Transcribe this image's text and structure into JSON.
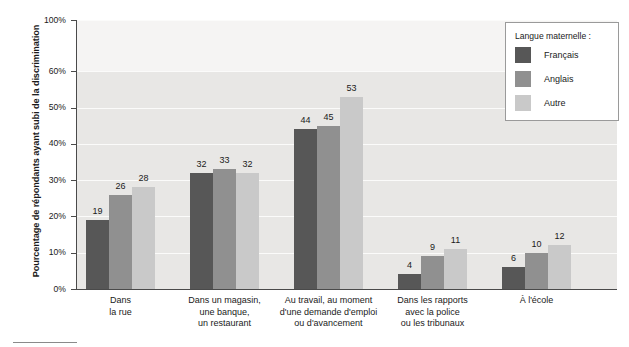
{
  "chart_data": {
    "type": "bar",
    "title": "",
    "xlabel": "",
    "ylabel": "Pourcentage de répondants ayant subi de la discrimination",
    "ylim": [
      0,
      100
    ],
    "grid": true,
    "axis_break": {
      "from": 60,
      "to": 100
    },
    "legend_position": "top-right",
    "legend_title": "Langue maternelle :",
    "categories": [
      "Dans\nla rue",
      "Dans un magasin,\nune banque,\nun restaurant",
      "Au travail, au moment\nd'une demande d'emploi\nou d'avancement",
      "Dans les rapports\navec la police\nou les tribunaux",
      "À l'école"
    ],
    "category_lines": [
      [
        "Dans",
        "la rue"
      ],
      [
        "Dans un magasin,",
        "une banque,",
        "un restaurant"
      ],
      [
        "Au travail, au moment",
        "d'une demande d'emploi",
        "ou d'avancement"
      ],
      [
        "Dans les rapports",
        "avec la police",
        "ou les tribunaux"
      ],
      [
        "À l'école"
      ]
    ],
    "series": [
      {
        "name": "Français",
        "color": "#575757",
        "values": [
          19,
          32,
          44,
          4,
          6
        ]
      },
      {
        "name": "Anglais",
        "color": "#909090",
        "values": [
          26,
          33,
          45,
          9,
          10
        ]
      },
      {
        "name": "Autre",
        "color": "#c9c9c9",
        "values": [
          28,
          32,
          53,
          11,
          12
        ]
      }
    ],
    "ytick_labels": [
      "100%",
      "60%",
      "50%",
      "40%",
      "30%",
      "20%",
      "10%",
      "0%"
    ],
    "ytick_values": [
      100,
      60,
      50,
      40,
      30,
      20,
      10,
      0
    ]
  },
  "legend": {
    "title": "Langue maternelle :",
    "items": [
      {
        "label": "Français",
        "color": "#575757"
      },
      {
        "label": "Anglais",
        "color": "#909090"
      },
      {
        "label": "Autre",
        "color": "#c9c9c9"
      }
    ]
  },
  "axis": {
    "y_title": "Pourcentage de répondants ayant subi de la discrimination",
    "y_ticks": [
      "100%",
      "60%",
      "50%",
      "40%",
      "30%",
      "20%",
      "10%",
      "0%"
    ]
  }
}
